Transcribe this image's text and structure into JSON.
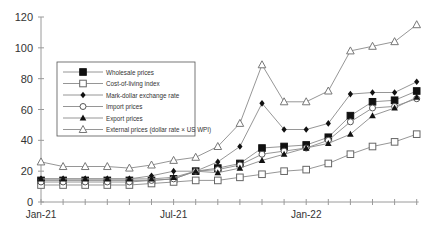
{
  "chart_data": {
    "type": "line",
    "title": "",
    "xlabel": "",
    "ylabel": "",
    "ylim": [
      0,
      120
    ],
    "yticks": [
      0,
      20,
      40,
      60,
      80,
      100,
      120
    ],
    "x": [
      "Jan-21",
      "Feb-21",
      "Mar-21",
      "Apr-21",
      "May-21",
      "Jun-21",
      "Jul-21",
      "Aug-21",
      "Sep-21",
      "Oct-21",
      "Nov-21",
      "Dec-21",
      "Jan-22",
      "Feb-22",
      "Mar-22",
      "Apr-22",
      "May-22",
      "Jun-22"
    ],
    "xtick_labels": [
      {
        "index": 0,
        "label": "Jan-21"
      },
      {
        "index": 6,
        "label": "Jul-21"
      },
      {
        "index": 12,
        "label": "Jan-22"
      }
    ],
    "grid": false,
    "legend_position": "upper-left-inset",
    "series": [
      {
        "name": "Wholesale prices",
        "marker": "filled-square",
        "values": [
          14,
          14,
          14,
          14,
          14,
          14,
          15,
          20,
          22,
          25,
          35,
          36,
          37,
          42,
          56,
          65,
          66,
          72
        ]
      },
      {
        "name": "Cost-of-living index",
        "marker": "open-square",
        "values": [
          11,
          11,
          11,
          11,
          11,
          12,
          13,
          14,
          14,
          16,
          18,
          20,
          21,
          25,
          31,
          36,
          39,
          44
        ]
      },
      {
        "name": "Mark-dollar exchange rate",
        "marker": "filled-diamond",
        "values": [
          15,
          15,
          15,
          15,
          15,
          17,
          20,
          20,
          26,
          36,
          64,
          47,
          47,
          51,
          70,
          71,
          71,
          78
        ]
      },
      {
        "name": "Import prices",
        "marker": "open-circle",
        "values": [
          13,
          13,
          13,
          13,
          13,
          14,
          15,
          20,
          21,
          24,
          31,
          33,
          35,
          40,
          52,
          61,
          62,
          67
        ]
      },
      {
        "name": "Export prices",
        "marker": "filled-triangle",
        "values": [
          15,
          15,
          15,
          15,
          15,
          15,
          16,
          20,
          19,
          22,
          27,
          31,
          35,
          38,
          44,
          56,
          61,
          68
        ]
      },
      {
        "name": "External prices (dollar rate × US WPI)",
        "marker": "open-triangle",
        "values": [
          26,
          23,
          23,
          23,
          22,
          24,
          27,
          29,
          36,
          51,
          89,
          65,
          65,
          72,
          98,
          101,
          104,
          115
        ]
      }
    ]
  }
}
